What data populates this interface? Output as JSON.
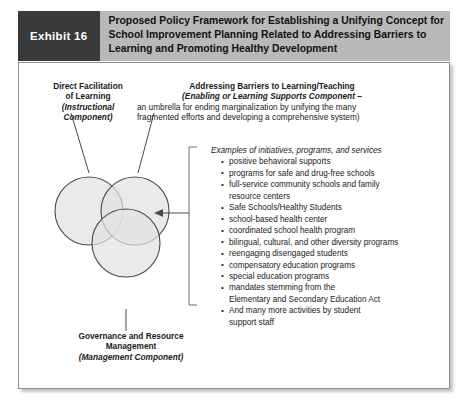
{
  "exhibit": {
    "tag_label": "Exhibit 16",
    "title_lines": [
      "Proposed Policy Framework for Establishing a Unifying Concept for",
      "School Improvement Planning Related to Addressing Barriers to",
      "Learning and Promoting Healthy Development"
    ]
  },
  "labels": {
    "instructional": {
      "line1": "Direct Facilitation",
      "line2": "of Learning",
      "line3": "(Instructional",
      "line4": "Component)"
    },
    "enabling": {
      "line1": "Addressing Barriers to Learning/Teaching",
      "line2": "(Enabling or Learning Supports Component –",
      "line3": "an umbrella for ending marginalization by unifying the many",
      "line4": "fragmented efforts and developing a comprehensive system)"
    },
    "management": {
      "line1": "Governance and Resource",
      "line2": "Management",
      "line3": "(Management Component)"
    }
  },
  "examples": {
    "heading": "Examples of initiatives, programs, and services",
    "items": [
      {
        "text": "positive behavioral supports",
        "cont": ""
      },
      {
        "text": "programs for safe and drug-free schools",
        "cont": ""
      },
      {
        "text": "full-service community schools and family",
        "cont": "resource centers"
      },
      {
        "text": "Safe Schools/Healthy Students",
        "cont": ""
      },
      {
        "text": "school-based health center",
        "cont": ""
      },
      {
        "text": "coordinated school health program",
        "cont": ""
      },
      {
        "text": "bilingual, cultural, and other diversity programs",
        "cont": ""
      },
      {
        "text": "reengaging disengaged students",
        "cont": ""
      },
      {
        "text": "compensatory education programs",
        "cont": ""
      },
      {
        "text": "special education programs",
        "cont": ""
      },
      {
        "text": "mandates stemming from the",
        "cont": "Elementary and Secondary Education Act"
      },
      {
        "text": "And many more activities by student",
        "cont": "support staff"
      }
    ]
  },
  "colors": {
    "header_band": "#b9b9b9",
    "exhibit_tag_bg": "#3a3a3a",
    "circle_fill": "#e2e2e2",
    "circle_stroke": "#4a4a4a",
    "panel_border": "#8e8e8e"
  },
  "icons": {
    "bullet": "bullet-point-icon",
    "pointer": "arrow-left-icon",
    "bracket": "bracket-icon"
  }
}
